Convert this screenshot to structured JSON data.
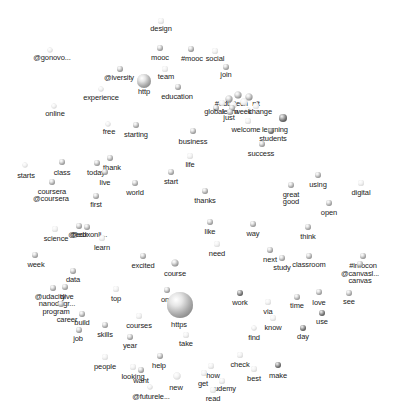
{
  "diagram": {
    "type": "word-network-3d-spheres",
    "background": "#ffffff",
    "label_color": "#222222",
    "sphere_color": "#a8a8a8",
    "nodes": [
      {
        "id": "design",
        "label": "design",
        "x": 161,
        "y": 21,
        "r": 3,
        "lx": 161,
        "ly": 25,
        "style": "faint"
      },
      {
        "id": "gonovo",
        "label": "@gonovo...",
        "x": 50,
        "y": 50,
        "r": 2.5,
        "lx": 52,
        "ly": 54,
        "style": "faint"
      },
      {
        "id": "mooc",
        "label": "mooc",
        "x": 160,
        "y": 48,
        "r": 3,
        "lx": 160,
        "ly": 54,
        "style": "normal"
      },
      {
        "id": "hashmooc",
        "label": "#mooc",
        "x": 191,
        "y": 49,
        "r": 3,
        "lx": 192,
        "ly": 55,
        "style": "normal"
      },
      {
        "id": "social",
        "label": "social",
        "x": 215,
        "y": 51,
        "r": 3,
        "lx": 215,
        "ly": 55,
        "style": "faint"
      },
      {
        "id": "iversity",
        "label": "@iversity",
        "x": 120,
        "y": 69,
        "r": 3,
        "lx": 119,
        "ly": 74,
        "style": "normal"
      },
      {
        "id": "http",
        "label": "http",
        "x": 144,
        "y": 81,
        "r": 7,
        "lx": 144,
        "ly": 88,
        "style": "normal"
      },
      {
        "id": "team",
        "label": "team",
        "x": 165,
        "y": 69,
        "r": 3,
        "lx": 166,
        "ly": 73,
        "style": "faint"
      },
      {
        "id": "join",
        "label": "join",
        "x": 226,
        "y": 67,
        "r": 3,
        "lx": 226,
        "ly": 71,
        "style": "normal"
      },
      {
        "id": "experience",
        "label": "experience",
        "x": 101,
        "y": 89,
        "r": 2.5,
        "lx": 101,
        "ly": 94,
        "style": "faint"
      },
      {
        "id": "education",
        "label": "education",
        "x": 178,
        "y": 87,
        "r": 3,
        "lx": 177,
        "ly": 93,
        "style": "normal"
      },
      {
        "id": "online",
        "label": "online",
        "x": 54,
        "y": 106,
        "r": 2.5,
        "lx": 55,
        "ly": 110,
        "style": "faint"
      },
      {
        "id": "free",
        "label": "free",
        "x": 108,
        "y": 124,
        "r": 2.5,
        "lx": 109,
        "ly": 128,
        "style": "faint"
      },
      {
        "id": "starting",
        "label": "starting",
        "x": 136,
        "y": 125,
        "r": 3,
        "lx": 136,
        "ly": 131,
        "style": "normal"
      },
      {
        "id": "business",
        "label": "business",
        "x": 193,
        "y": 131,
        "r": 3,
        "lx": 193,
        "ly": 138,
        "style": "normal"
      },
      {
        "id": "cluster1",
        "label": "#edu",
        "x": 229,
        "y": 99,
        "r": 3.5,
        "lx": 223,
        "ly": 100,
        "style": "normal"
      },
      {
        "id": "cluster2",
        "label": "tech",
        "x": 238,
        "y": 95,
        "r": 3.5,
        "lx": 241,
        "ly": 100,
        "style": "normal"
      },
      {
        "id": "cluster3",
        "label": "n't",
        "x": 249,
        "y": 97,
        "r": 3.5,
        "lx": 256,
        "ly": 100,
        "style": "normal"
      },
      {
        "id": "cluster4",
        "label": "",
        "x": 244,
        "y": 102,
        "r": 3.5,
        "lx": 244,
        "ly": 106,
        "style": "faint"
      },
      {
        "id": "cluster5",
        "label": "",
        "x": 233,
        "y": 105,
        "r": 3.5,
        "lx": 233,
        "ly": 110,
        "style": "faint"
      },
      {
        "id": "cluster6",
        "label": "",
        "x": 222,
        "y": 103,
        "r": 3,
        "lx": 222,
        "ly": 108,
        "style": "faint"
      },
      {
        "id": "global",
        "label": "global",
        "x": 216,
        "y": 108,
        "r": 3,
        "lx": 214,
        "ly": 108,
        "style": "normal"
      },
      {
        "id": "learn2",
        "label": "learn",
        "x": 232,
        "y": 108,
        "r": 3,
        "lx": 230,
        "ly": 108,
        "style": "normal"
      },
      {
        "id": "week2",
        "label": "week",
        "x": 248,
        "y": 110,
        "r": 2.5,
        "lx": 243,
        "ly": 108,
        "style": "faint"
      },
      {
        "id": "change",
        "label": "change",
        "x": 256,
        "y": 106,
        "r": 3,
        "lx": 260,
        "ly": 108,
        "style": "faint"
      },
      {
        "id": "just",
        "label": "just",
        "x": 230,
        "y": 112,
        "r": 3,
        "lx": 229,
        "ly": 114,
        "style": "normal"
      },
      {
        "id": "welcome",
        "label": "welcome",
        "x": 248,
        "y": 121,
        "r": 3,
        "lx": 246,
        "ly": 126,
        "style": "faint"
      },
      {
        "id": "learning",
        "label": "learning",
        "x": 283,
        "y": 118,
        "r": 4,
        "lx": 275,
        "ly": 126,
        "style": "dark"
      },
      {
        "id": "students",
        "label": "students",
        "x": 271,
        "y": 131,
        "r": 3,
        "lx": 273,
        "ly": 135,
        "style": "dark"
      },
      {
        "id": "success",
        "label": "success",
        "x": 262,
        "y": 144,
        "r": 3,
        "lx": 261,
        "ly": 150,
        "style": "normal"
      },
      {
        "id": "class",
        "label": "class",
        "x": 62,
        "y": 162,
        "r": 3,
        "lx": 62,
        "ly": 169,
        "style": "normal"
      },
      {
        "id": "starts",
        "label": "starts",
        "x": 25,
        "y": 165,
        "r": 2.5,
        "lx": 26,
        "ly": 172,
        "style": "faint"
      },
      {
        "id": "thank",
        "label": "thank",
        "x": 110,
        "y": 158,
        "r": 3,
        "lx": 112,
        "ly": 164,
        "style": "normal"
      },
      {
        "id": "today",
        "label": "today",
        "x": 97,
        "y": 163,
        "r": 3,
        "lx": 96,
        "ly": 169,
        "style": "normal"
      },
      {
        "id": "live",
        "label": "live",
        "x": 105,
        "y": 172,
        "r": 3,
        "lx": 105,
        "ly": 179,
        "style": "normal"
      },
      {
        "id": "life",
        "label": "life",
        "x": 190,
        "y": 156,
        "r": 3,
        "lx": 190,
        "ly": 161,
        "style": "faint"
      },
      {
        "id": "coursera",
        "label": "coursera",
        "x": 52,
        "y": 182,
        "r": 3,
        "lx": 52,
        "ly": 188,
        "style": "normal"
      },
      {
        "id": "atcoursera",
        "label": "@coursera",
        "x": 52,
        "y": 186,
        "r": 0,
        "lx": 51,
        "ly": 195,
        "style": "none"
      },
      {
        "id": "start",
        "label": "start",
        "x": 171,
        "y": 172,
        "r": 3,
        "lx": 171,
        "ly": 178,
        "style": "normal"
      },
      {
        "id": "world",
        "label": "world",
        "x": 135,
        "y": 183,
        "r": 3,
        "lx": 135,
        "ly": 189,
        "style": "normal"
      },
      {
        "id": "first",
        "label": "first",
        "x": 96,
        "y": 196,
        "r": 3,
        "lx": 96,
        "ly": 201,
        "style": "normal"
      },
      {
        "id": "thanks",
        "label": "thanks",
        "x": 205,
        "y": 191,
        "r": 3,
        "lx": 205,
        "ly": 197,
        "style": "normal"
      },
      {
        "id": "using",
        "label": "using",
        "x": 318,
        "y": 175,
        "r": 3,
        "lx": 318,
        "ly": 181,
        "style": "normal"
      },
      {
        "id": "digital",
        "label": "digital",
        "x": 361,
        "y": 183,
        "r": 3,
        "lx": 361,
        "ly": 189,
        "style": "faint"
      },
      {
        "id": "great",
        "label": "great",
        "x": 291,
        "y": 185,
        "r": 3,
        "lx": 291,
        "ly": 191,
        "style": "normal"
      },
      {
        "id": "good",
        "label": "good",
        "x": 291,
        "y": 190,
        "r": 0,
        "lx": 291,
        "ly": 198,
        "style": "none"
      },
      {
        "id": "open",
        "label": "open",
        "x": 329,
        "y": 203,
        "r": 3,
        "lx": 329,
        "ly": 209,
        "style": "normal"
      },
      {
        "id": "science",
        "label": "science",
        "x": 55,
        "y": 229,
        "r": 3,
        "lx": 56,
        "ly": 235,
        "style": "faint"
      },
      {
        "id": "edx",
        "label": "@edx",
        "x": 79,
        "y": 226,
        "r": 3,
        "lx": 78,
        "ly": 231,
        "style": "normal"
      },
      {
        "id": "futurelearn_online",
        "label": "@edxonli...",
        "x": 87,
        "y": 227,
        "r": 3,
        "lx": 89,
        "ly": 231,
        "style": "normal"
      },
      {
        "id": "learn",
        "label": "learn",
        "x": 102,
        "y": 238,
        "r": 3,
        "lx": 102,
        "ly": 244,
        "style": "faint"
      },
      {
        "id": "like",
        "label": "like",
        "x": 210,
        "y": 222,
        "r": 3,
        "lx": 210,
        "ly": 228,
        "style": "normal"
      },
      {
        "id": "way",
        "label": "way",
        "x": 253,
        "y": 224,
        "r": 3,
        "lx": 253,
        "ly": 230,
        "style": "normal"
      },
      {
        "id": "think",
        "label": "think",
        "x": 308,
        "y": 227,
        "r": 3,
        "lx": 308,
        "ly": 233,
        "style": "normal"
      },
      {
        "id": "need",
        "label": "need",
        "x": 217,
        "y": 244,
        "r": 3,
        "lx": 217,
        "ly": 250,
        "style": "faint"
      },
      {
        "id": "week",
        "label": "week",
        "x": 35,
        "y": 255,
        "r": 3,
        "lx": 36,
        "ly": 261,
        "style": "normal"
      },
      {
        "id": "next",
        "label": "next",
        "x": 270,
        "y": 250,
        "r": 3,
        "lx": 270,
        "ly": 256,
        "style": "normal"
      },
      {
        "id": "study",
        "label": "study",
        "x": 282,
        "y": 258,
        "r": 3,
        "lx": 282,
        "ly": 264,
        "style": "normal"
      },
      {
        "id": "classroom",
        "label": "classroom",
        "x": 309,
        "y": 256,
        "r": 3,
        "lx": 309,
        "ly": 261,
        "style": "normal"
      },
      {
        "id": "infinicon",
        "label": "#infocon",
        "x": 363,
        "y": 256,
        "r": 3,
        "lx": 363,
        "ly": 262,
        "style": "normal"
      },
      {
        "id": "canvasl",
        "label": "@canvasl...",
        "x": 360,
        "y": 264,
        "r": 3,
        "lx": 360,
        "ly": 270,
        "style": "normal"
      },
      {
        "id": "canvas",
        "label": "canvas",
        "x": 360,
        "y": 270,
        "r": 0,
        "lx": 360,
        "ly": 277,
        "style": "none"
      },
      {
        "id": "excited",
        "label": "excited",
        "x": 143,
        "y": 256,
        "r": 3,
        "lx": 143,
        "ly": 262,
        "style": "normal"
      },
      {
        "id": "course",
        "label": "course",
        "x": 175,
        "y": 263,
        "r": 3.5,
        "lx": 175,
        "ly": 270,
        "style": "normal"
      },
      {
        "id": "data",
        "label": "data",
        "x": 73,
        "y": 271,
        "r": 3,
        "lx": 73,
        "ly": 276,
        "style": "normal"
      },
      {
        "id": "udacity",
        "label": "@udacity",
        "x": 53,
        "y": 288,
        "r": 3,
        "lx": 50,
        "ly": 293,
        "style": "normal"
      },
      {
        "id": "dive",
        "label": "dive",
        "x": 65,
        "y": 287,
        "r": 3,
        "lx": 67,
        "ly": 293,
        "style": "normal"
      },
      {
        "id": "nanodegree",
        "label": "nanodegr...",
        "x": 57,
        "y": 294,
        "r": 0,
        "lx": 57,
        "ly": 300,
        "style": "none"
      },
      {
        "id": "program",
        "label": "program",
        "x": 61,
        "y": 304,
        "r": 3,
        "lx": 56,
        "ly": 308,
        "style": "normal"
      },
      {
        "id": "career",
        "label": "career",
        "x": 68,
        "y": 310,
        "r": 0,
        "lx": 67,
        "ly": 316,
        "style": "none"
      },
      {
        "id": "build",
        "label": "build",
        "x": 82,
        "y": 314,
        "r": 3,
        "lx": 82,
        "ly": 319,
        "style": "normal"
      },
      {
        "id": "job",
        "label": "job",
        "x": 79,
        "y": 330,
        "r": 3,
        "lx": 78,
        "ly": 335,
        "style": "normal"
      },
      {
        "id": "top",
        "label": "top",
        "x": 116,
        "y": 289,
        "r": 3,
        "lx": 116,
        "ly": 295,
        "style": "faint"
      },
      {
        "id": "one",
        "label": "one",
        "x": 167,
        "y": 290,
        "r": 3,
        "lx": 167,
        "ly": 296,
        "style": "normal"
      },
      {
        "id": "https",
        "label": "https",
        "x": 180,
        "y": 305,
        "r": 13,
        "lx": 179,
        "ly": 321,
        "style": "normal"
      },
      {
        "id": "work",
        "label": "work",
        "x": 240,
        "y": 293,
        "r": 3,
        "lx": 240,
        "ly": 299,
        "style": "dark"
      },
      {
        "id": "via",
        "label": "via",
        "x": 268,
        "y": 302,
        "r": 3,
        "lx": 268,
        "ly": 308,
        "style": "faint"
      },
      {
        "id": "time",
        "label": "time",
        "x": 297,
        "y": 297,
        "r": 3,
        "lx": 297,
        "ly": 302,
        "style": "normal"
      },
      {
        "id": "love",
        "label": "love",
        "x": 319,
        "y": 292,
        "r": 3,
        "lx": 319,
        "ly": 299,
        "style": "normal"
      },
      {
        "id": "see",
        "label": "see",
        "x": 349,
        "y": 293,
        "r": 3,
        "lx": 349,
        "ly": 298,
        "style": "normal"
      },
      {
        "id": "use",
        "label": "use",
        "x": 322,
        "y": 313,
        "r": 3,
        "lx": 322,
        "ly": 318,
        "style": "dark"
      },
      {
        "id": "know",
        "label": "know",
        "x": 273,
        "y": 318,
        "r": 3,
        "lx": 273,
        "ly": 324,
        "style": "faint"
      },
      {
        "id": "courses",
        "label": "courses",
        "x": 139,
        "y": 316,
        "r": 3,
        "lx": 139,
        "ly": 322,
        "style": "faint"
      },
      {
        "id": "skills",
        "label": "skills",
        "x": 105,
        "y": 325,
        "r": 3,
        "lx": 105,
        "ly": 331,
        "style": "normal"
      },
      {
        "id": "take",
        "label": "take",
        "x": 186,
        "y": 335,
        "r": 3,
        "lx": 186,
        "ly": 340,
        "style": "faint"
      },
      {
        "id": "day",
        "label": "day",
        "x": 303,
        "y": 328,
        "r": 3,
        "lx": 303,
        "ly": 333,
        "style": "dark"
      },
      {
        "id": "find",
        "label": "find",
        "x": 254,
        "y": 328,
        "r": 2.5,
        "lx": 254,
        "ly": 334,
        "style": "faint"
      },
      {
        "id": "year",
        "label": "year",
        "x": 130,
        "y": 337,
        "r": 3,
        "lx": 130,
        "ly": 342,
        "style": "normal"
      },
      {
        "id": "people",
        "label": "people",
        "x": 105,
        "y": 357,
        "r": 3,
        "lx": 105,
        "ly": 363,
        "style": "faint"
      },
      {
        "id": "help",
        "label": "help",
        "x": 160,
        "y": 356,
        "r": 3,
        "lx": 159,
        "ly": 362,
        "style": "normal"
      },
      {
        "id": "check",
        "label": "check",
        "x": 240,
        "y": 355,
        "r": 3,
        "lx": 240,
        "ly": 361,
        "style": "faint"
      },
      {
        "id": "looking",
        "label": "looking",
        "x": 133,
        "y": 367,
        "r": 3,
        "lx": 133,
        "ly": 373,
        "style": "faint"
      },
      {
        "id": "want",
        "label": "want",
        "x": 141,
        "y": 370,
        "r": 3,
        "lx": 141,
        "ly": 377,
        "style": "normal"
      },
      {
        "id": "new",
        "label": "new",
        "x": 177,
        "y": 376,
        "r": 3.5,
        "lx": 176,
        "ly": 384,
        "style": "faint"
      },
      {
        "id": "make",
        "label": "make",
        "x": 278,
        "y": 365,
        "r": 3,
        "lx": 278,
        "ly": 372,
        "style": "dark"
      },
      {
        "id": "best",
        "label": "best",
        "x": 254,
        "y": 369,
        "r": 3,
        "lx": 254,
        "ly": 375,
        "style": "faint"
      },
      {
        "id": "how",
        "label": "how",
        "x": 211,
        "y": 366,
        "r": 3,
        "lx": 213,
        "ly": 372,
        "style": "faint"
      },
      {
        "id": "get",
        "label": "get",
        "x": 204,
        "y": 373,
        "r": 3,
        "lx": 203,
        "ly": 380,
        "style": "faint"
      },
      {
        "id": "udemy",
        "label": "udemy",
        "x": 222,
        "y": 381,
        "r": 3,
        "lx": 225,
        "ly": 385,
        "style": "faint"
      },
      {
        "id": "read",
        "label": "read",
        "x": 213,
        "y": 390,
        "r": 3,
        "lx": 213,
        "ly": 395,
        "style": "faint"
      },
      {
        "id": "futurelearn",
        "label": "@futurele...",
        "x": 150,
        "y": 387,
        "r": 2.5,
        "lx": 151,
        "ly": 393,
        "style": "faint"
      }
    ]
  }
}
